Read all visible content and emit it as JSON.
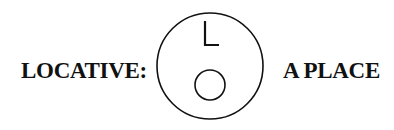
{
  "diagram": {
    "left_label": "LOCATIVE:",
    "right_label": "A PLACE",
    "symbol": {
      "outer_shape": "circle",
      "marker_letter": "L",
      "inner_shape": "circle"
    },
    "colors": {
      "stroke": "#111111",
      "background": "#ffffff"
    }
  }
}
